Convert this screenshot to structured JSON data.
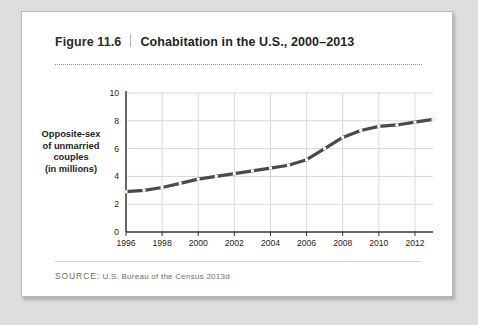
{
  "figure": {
    "number": "Figure 11.6",
    "title": "Cohabitation in the U.S., 2000–2013",
    "source_label": "SOURCE:",
    "source_text": " U.S. Bureau of the Census 2013d"
  },
  "colors": {
    "page_background": "#dedede",
    "card_background": "#ffffff",
    "card_border": "#b9b9b9",
    "line": "#4a4a4a",
    "grid": "#d8d8d8",
    "axis": "#333333",
    "text": "#1d1d1d",
    "source_text": "#6d6d6d",
    "marker_fill": "#ffffff"
  },
  "chart_data": {
    "type": "line",
    "title": "Cohabitation in the U.S., 2000–2013",
    "xlabel": "",
    "ylabel": "Opposite-sex of unmarried couples (in millions)",
    "ylabel_lines": [
      "Opposite-sex",
      "of unmarried",
      "couples",
      "(in millions)"
    ],
    "xlim": [
      1996,
      2013
    ],
    "ylim": [
      0,
      10
    ],
    "yticks": [
      0,
      2,
      4,
      6,
      8,
      10
    ],
    "ytick_labels": [
      "0",
      "2",
      "4",
      "6",
      "8",
      "10"
    ],
    "xticks": [
      1996,
      1998,
      2000,
      2002,
      2004,
      2006,
      2008,
      2010,
      2012
    ],
    "xtick_labels": [
      "1996",
      "1998",
      "2000",
      "2002",
      "2004",
      "2006",
      "2008",
      "2010",
      "2012"
    ],
    "grid": true,
    "legend": false,
    "x": [
      1996,
      1997,
      1998,
      1999,
      2000,
      2001,
      2002,
      2003,
      2004,
      2005,
      2006,
      2007,
      2008,
      2009,
      2010,
      2011,
      2012,
      2013
    ],
    "values": [
      2.9,
      3.0,
      3.2,
      3.5,
      3.8,
      4.0,
      4.2,
      4.4,
      4.6,
      4.8,
      5.2,
      6.0,
      6.8,
      7.3,
      7.6,
      7.7,
      7.9,
      8.1
    ],
    "series": [
      {
        "name": "Opposite-sex unmarried couples",
        "values": [
          2.9,
          3.0,
          3.2,
          3.5,
          3.8,
          4.0,
          4.2,
          4.4,
          4.6,
          4.8,
          5.2,
          6.0,
          6.8,
          7.3,
          7.6,
          7.7,
          7.9,
          8.1
        ]
      }
    ]
  }
}
